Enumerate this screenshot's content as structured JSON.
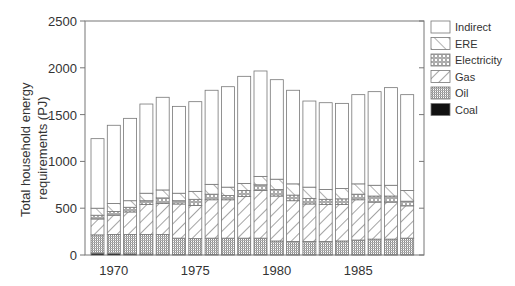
{
  "chart_data": {
    "type": "bar",
    "stacked": true,
    "title": "",
    "xlabel": "",
    "ylabel": "Total household energy requirements (PJ)",
    "ylabel_lines": [
      "Total household energy",
      "requirements (PJ)"
    ],
    "ylim": [
      0,
      2500
    ],
    "yticks": [
      0,
      500,
      1000,
      1500,
      2000,
      2500
    ],
    "xticks": [
      1970,
      1975,
      1980,
      1985
    ],
    "grid": false,
    "legend_position": "right",
    "categories": [
      1969,
      1970,
      1971,
      1972,
      1973,
      1974,
      1975,
      1976,
      1977,
      1978,
      1979,
      1980,
      1981,
      1982,
      1983,
      1984,
      1985,
      1986,
      1987,
      1988
    ],
    "series": [
      {
        "name": "Coal",
        "pattern": "solid-black",
        "values": [
          20,
          15,
          12,
          10,
          8,
          6,
          5,
          5,
          4,
          4,
          4,
          3,
          3,
          3,
          3,
          3,
          3,
          3,
          3,
          3
        ]
      },
      {
        "name": "Oil",
        "pattern": "vertical-lines",
        "values": [
          195,
          205,
          208,
          210,
          212,
          174,
          170,
          175,
          176,
          176,
          176,
          147,
          142,
          142,
          142,
          147,
          157,
          167,
          167,
          177
        ]
      },
      {
        "name": "Gas",
        "pattern": "diagonal-lines",
        "values": [
          170,
          205,
          240,
          320,
          330,
          365,
          355,
          410,
          410,
          445,
          510,
          480,
          435,
          400,
          395,
          390,
          430,
          395,
          395,
          345
        ]
      },
      {
        "name": "Electricity",
        "pattern": "crosshatch",
        "values": [
          40,
          40,
          50,
          40,
          60,
          35,
          65,
          60,
          45,
          65,
          60,
          70,
          60,
          60,
          55,
          60,
          60,
          65,
          65,
          50
        ]
      },
      {
        "name": "ERE",
        "pattern": "diagonal-sparse",
        "values": [
          75,
          85,
          70,
          80,
          85,
          80,
          85,
          105,
          90,
          75,
          90,
          110,
          120,
          120,
          105,
          110,
          110,
          115,
          115,
          115
        ]
      },
      {
        "name": "Indirect",
        "pattern": "none",
        "values": [
          743,
          836,
          880,
          953,
          990,
          928,
          958,
          1005,
          1073,
          1144,
          1126,
          1063,
          1000,
          920,
          927,
          910,
          953,
          1000,
          1043,
          1023
        ]
      }
    ],
    "totals": [
      1243,
      1386,
      1460,
      1613,
      1685,
      1588,
      1638,
      1760,
      1798,
      1909,
      1966,
      1873,
      1760,
      1645,
      1627,
      1620,
      1713,
      1745,
      1788,
      1713
    ]
  },
  "legend": {
    "items": [
      {
        "label": "Indirect",
        "pattern": "none"
      },
      {
        "label": "ERE",
        "pattern": "diagonal-sparse"
      },
      {
        "label": "Electricity",
        "pattern": "crosshatch"
      },
      {
        "label": "Gas",
        "pattern": "diagonal-lines"
      },
      {
        "label": "Oil",
        "pattern": "vertical-lines"
      },
      {
        "label": "Coal",
        "pattern": "solid-black"
      }
    ]
  },
  "colors": {
    "axis": "#777777",
    "bar_edge": "#777777",
    "text": "#333333",
    "coal": "#111111"
  }
}
